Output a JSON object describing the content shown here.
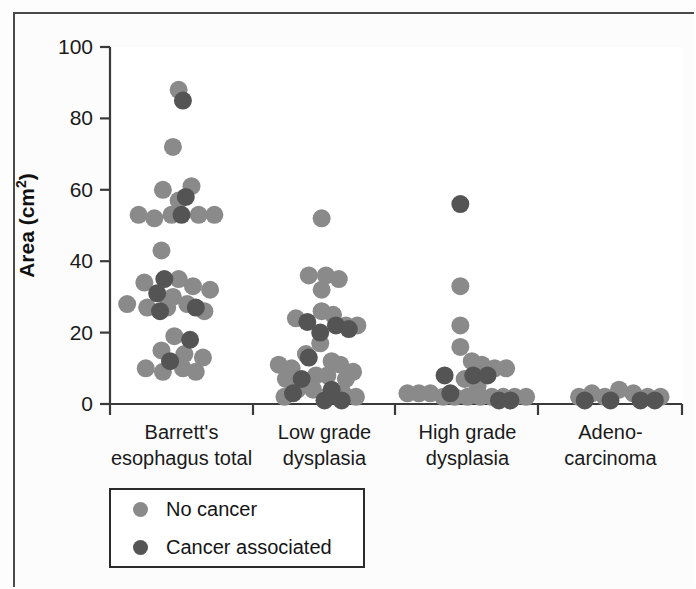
{
  "figure": {
    "background": "#fdfdfd",
    "frame_color": "#4a4a4a"
  },
  "legend": {
    "items": [
      {
        "label": "No cancer",
        "color": "#8a8a8a",
        "key": "no_cancer"
      },
      {
        "label": "Cancer associated",
        "color": "#545454",
        "key": "cancer_associated"
      }
    ]
  },
  "chart_data": {
    "type": "scatter",
    "title": "",
    "subtitle": "",
    "xlabel": "",
    "ylabel": "Area (cm2)",
    "ylabel_display": "Area (cm",
    "ylabel_superscript": "2",
    "ylabel_suffix": ")",
    "ylim": [
      0,
      100
    ],
    "yticks": [
      0,
      20,
      40,
      60,
      80,
      100
    ],
    "ytick_labels": [
      "0",
      "20",
      "40",
      "60",
      "80",
      "100"
    ],
    "grid": false,
    "legend_position": "below-axes-left",
    "colors": {
      "no_cancer": "#8a8a8a",
      "cancer_associated": "#545454"
    },
    "categories": [
      "Barrett's esophagus total",
      "Low grade dysplasia",
      "High grade dysplasia",
      "Adenocarcinoma"
    ],
    "category_labels": [
      [
        "Barrett's",
        "esophagus total"
      ],
      [
        "Low grade",
        "dysplasia"
      ],
      [
        "High grade",
        "dysplasia"
      ],
      [
        "Adeno-",
        "carcinoma"
      ]
    ],
    "series": [
      {
        "name": "No cancer",
        "color": "#8a8a8a",
        "points": [
          {
            "category": 0,
            "offset": -0.02,
            "value": 88
          },
          {
            "category": 0,
            "offset": -0.06,
            "value": 72
          },
          {
            "category": 0,
            "offset": -0.13,
            "value": 60
          },
          {
            "category": 0,
            "offset": 0.07,
            "value": 61
          },
          {
            "category": 0,
            "offset": -0.02,
            "value": 57
          },
          {
            "category": 0,
            "offset": -0.3,
            "value": 53
          },
          {
            "category": 0,
            "offset": -0.19,
            "value": 52
          },
          {
            "category": 0,
            "offset": -0.07,
            "value": 53
          },
          {
            "category": 0,
            "offset": 0.12,
            "value": 53
          },
          {
            "category": 0,
            "offset": 0.23,
            "value": 53
          },
          {
            "category": 0,
            "offset": -0.14,
            "value": 43
          },
          {
            "category": 0,
            "offset": -0.26,
            "value": 34
          },
          {
            "category": 0,
            "offset": -0.02,
            "value": 35
          },
          {
            "category": 0,
            "offset": 0.08,
            "value": 33
          },
          {
            "category": 0,
            "offset": 0.2,
            "value": 32
          },
          {
            "category": 0,
            "offset": -0.06,
            "value": 30
          },
          {
            "category": 0,
            "offset": -0.38,
            "value": 28
          },
          {
            "category": 0,
            "offset": -0.24,
            "value": 27
          },
          {
            "category": 0,
            "offset": -0.1,
            "value": 27
          },
          {
            "category": 0,
            "offset": 0.04,
            "value": 28
          },
          {
            "category": 0,
            "offset": 0.16,
            "value": 26
          },
          {
            "category": 0,
            "offset": -0.05,
            "value": 19
          },
          {
            "category": 0,
            "offset": -0.14,
            "value": 15
          },
          {
            "category": 0,
            "offset": 0.02,
            "value": 14
          },
          {
            "category": 0,
            "offset": 0.15,
            "value": 13
          },
          {
            "category": 0,
            "offset": -0.25,
            "value": 10
          },
          {
            "category": 0,
            "offset": -0.13,
            "value": 9
          },
          {
            "category": 0,
            "offset": 0.01,
            "value": 10
          },
          {
            "category": 0,
            "offset": 0.1,
            "value": 9
          },
          {
            "category": 1,
            "offset": -0.02,
            "value": 52
          },
          {
            "category": 1,
            "offset": -0.11,
            "value": 36
          },
          {
            "category": 1,
            "offset": 0.01,
            "value": 36
          },
          {
            "category": 1,
            "offset": 0.1,
            "value": 35
          },
          {
            "category": 1,
            "offset": -0.02,
            "value": 32
          },
          {
            "category": 1,
            "offset": -0.2,
            "value": 24
          },
          {
            "category": 1,
            "offset": -0.02,
            "value": 26
          },
          {
            "category": 1,
            "offset": 0.06,
            "value": 25
          },
          {
            "category": 1,
            "offset": 0.15,
            "value": 22
          },
          {
            "category": 1,
            "offset": 0.23,
            "value": 22
          },
          {
            "category": 1,
            "offset": -0.03,
            "value": 17
          },
          {
            "category": 1,
            "offset": -0.13,
            "value": 14
          },
          {
            "category": 1,
            "offset": -0.32,
            "value": 11
          },
          {
            "category": 1,
            "offset": -0.23,
            "value": 10
          },
          {
            "category": 1,
            "offset": 0.05,
            "value": 12
          },
          {
            "category": 1,
            "offset": 0.11,
            "value": 11
          },
          {
            "category": 1,
            "offset": 0.2,
            "value": 9
          },
          {
            "category": 1,
            "offset": -0.27,
            "value": 7
          },
          {
            "category": 1,
            "offset": -0.06,
            "value": 8
          },
          {
            "category": 1,
            "offset": 0.02,
            "value": 8
          },
          {
            "category": 1,
            "offset": 0.15,
            "value": 7
          },
          {
            "category": 1,
            "offset": -0.19,
            "value": 4
          },
          {
            "category": 1,
            "offset": -0.08,
            "value": 4
          },
          {
            "category": 1,
            "offset": 0.04,
            "value": 3
          },
          {
            "category": 1,
            "offset": 0.13,
            "value": 3
          },
          {
            "category": 1,
            "offset": -0.28,
            "value": 2
          },
          {
            "category": 1,
            "offset": 0.22,
            "value": 2
          },
          {
            "category": 2,
            "offset": -0.05,
            "value": 33
          },
          {
            "category": 2,
            "offset": -0.05,
            "value": 22
          },
          {
            "category": 2,
            "offset": -0.05,
            "value": 16
          },
          {
            "category": 2,
            "offset": 0.03,
            "value": 12
          },
          {
            "category": 2,
            "offset": 0.1,
            "value": 11
          },
          {
            "category": 2,
            "offset": 0.19,
            "value": 10
          },
          {
            "category": 2,
            "offset": 0.27,
            "value": 10
          },
          {
            "category": 2,
            "offset": -0.02,
            "value": 7
          },
          {
            "category": 2,
            "offset": 0.07,
            "value": 5
          },
          {
            "category": 2,
            "offset": -0.42,
            "value": 3
          },
          {
            "category": 2,
            "offset": -0.34,
            "value": 3
          },
          {
            "category": 2,
            "offset": -0.26,
            "value": 3
          },
          {
            "category": 2,
            "offset": -0.17,
            "value": 2
          },
          {
            "category": 2,
            "offset": -0.09,
            "value": 2
          },
          {
            "category": 2,
            "offset": 0.0,
            "value": 2
          },
          {
            "category": 2,
            "offset": 0.09,
            "value": 2
          },
          {
            "category": 2,
            "offset": 0.17,
            "value": 2
          },
          {
            "category": 2,
            "offset": 0.25,
            "value": 2
          },
          {
            "category": 2,
            "offset": 0.33,
            "value": 2
          },
          {
            "category": 2,
            "offset": 0.41,
            "value": 2
          },
          {
            "category": 3,
            "offset": -0.22,
            "value": 2
          },
          {
            "category": 3,
            "offset": -0.13,
            "value": 3
          },
          {
            "category": 3,
            "offset": -0.04,
            "value": 2
          },
          {
            "category": 3,
            "offset": 0.06,
            "value": 4
          },
          {
            "category": 3,
            "offset": 0.16,
            "value": 3
          },
          {
            "category": 3,
            "offset": 0.26,
            "value": 2
          },
          {
            "category": 3,
            "offset": 0.35,
            "value": 2
          }
        ]
      },
      {
        "name": "Cancer associated",
        "color": "#545454",
        "points": [
          {
            "category": 0,
            "offset": 0.01,
            "value": 85
          },
          {
            "category": 0,
            "offset": 0.03,
            "value": 58
          },
          {
            "category": 0,
            "offset": 0.0,
            "value": 53
          },
          {
            "category": 0,
            "offset": -0.12,
            "value": 35
          },
          {
            "category": 0,
            "offset": -0.17,
            "value": 31
          },
          {
            "category": 0,
            "offset": -0.15,
            "value": 26
          },
          {
            "category": 0,
            "offset": 0.1,
            "value": 27
          },
          {
            "category": 0,
            "offset": 0.06,
            "value": 18
          },
          {
            "category": 0,
            "offset": -0.08,
            "value": 12
          },
          {
            "category": 1,
            "offset": -0.12,
            "value": 23
          },
          {
            "category": 1,
            "offset": 0.08,
            "value": 22
          },
          {
            "category": 1,
            "offset": 0.17,
            "value": 21
          },
          {
            "category": 1,
            "offset": -0.03,
            "value": 20
          },
          {
            "category": 1,
            "offset": -0.11,
            "value": 13
          },
          {
            "category": 1,
            "offset": -0.16,
            "value": 7
          },
          {
            "category": 1,
            "offset": -0.22,
            "value": 3
          },
          {
            "category": 1,
            "offset": 0.05,
            "value": 4
          },
          {
            "category": 1,
            "offset": 0.0,
            "value": 1
          },
          {
            "category": 1,
            "offset": 0.12,
            "value": 1
          },
          {
            "category": 2,
            "offset": -0.05,
            "value": 56
          },
          {
            "category": 2,
            "offset": -0.16,
            "value": 8
          },
          {
            "category": 2,
            "offset": 0.04,
            "value": 8
          },
          {
            "category": 2,
            "offset": 0.14,
            "value": 8
          },
          {
            "category": 2,
            "offset": -0.12,
            "value": 3
          },
          {
            "category": 2,
            "offset": 0.22,
            "value": 1
          },
          {
            "category": 2,
            "offset": 0.3,
            "value": 1
          },
          {
            "category": 3,
            "offset": -0.18,
            "value": 1
          },
          {
            "category": 3,
            "offset": 0.0,
            "value": 1
          },
          {
            "category": 3,
            "offset": 0.21,
            "value": 1
          },
          {
            "category": 3,
            "offset": 0.31,
            "value": 1
          }
        ]
      }
    ],
    "point_radius": 9,
    "axes_geometry": {
      "x_left": 110,
      "x_right": 682,
      "y_top": 47,
      "y_bottom": 404,
      "category_tick_x": [
        110,
        253,
        395,
        538,
        682
      ]
    }
  }
}
